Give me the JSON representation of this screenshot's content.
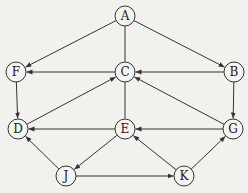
{
  "diagram": {
    "type": "directed-graph",
    "node_radius": 10,
    "colors": {
      "stroke": "#333333",
      "fill": "#f4f4f1",
      "background": "#f1f1ee"
    },
    "nodes": [
      {
        "id": "A",
        "label": "A",
        "x": 125,
        "y": 16
      },
      {
        "id": "F",
        "label": "F",
        "x": 16,
        "y": 72
      },
      {
        "id": "C",
        "label": "C",
        "x": 125,
        "y": 72
      },
      {
        "id": "B",
        "label": "B",
        "x": 234,
        "y": 72
      },
      {
        "id": "D",
        "label": "D",
        "x": 18,
        "y": 129
      },
      {
        "id": "E",
        "label": "E",
        "x": 125,
        "y": 129
      },
      {
        "id": "G",
        "label": "G",
        "x": 233,
        "y": 129
      },
      {
        "id": "J",
        "label": "J",
        "x": 66,
        "y": 176
      },
      {
        "id": "K",
        "label": "K",
        "x": 184,
        "y": 176
      }
    ],
    "edges": [
      {
        "from": "A",
        "to": "F",
        "directed": true
      },
      {
        "from": "A",
        "to": "C",
        "directed": false
      },
      {
        "from": "A",
        "to": "B",
        "directed": true
      },
      {
        "from": "C",
        "to": "F",
        "directed": true
      },
      {
        "from": "B",
        "to": "C",
        "directed": true
      },
      {
        "from": "D",
        "to": "C",
        "directed": true
      },
      {
        "from": "G",
        "to": "C",
        "directed": true
      },
      {
        "from": "C",
        "to": "E",
        "directed": false
      },
      {
        "from": "F",
        "to": "D",
        "directed": true
      },
      {
        "from": "B",
        "to": "G",
        "directed": true
      },
      {
        "from": "E",
        "to": "D",
        "directed": true
      },
      {
        "from": "G",
        "to": "E",
        "directed": true
      },
      {
        "from": "E",
        "to": "J",
        "directed": true
      },
      {
        "from": "K",
        "to": "E",
        "directed": true
      },
      {
        "from": "J",
        "to": "D",
        "directed": true
      },
      {
        "from": "J",
        "to": "K",
        "directed": true
      },
      {
        "from": "K",
        "to": "G",
        "directed": true
      }
    ]
  }
}
